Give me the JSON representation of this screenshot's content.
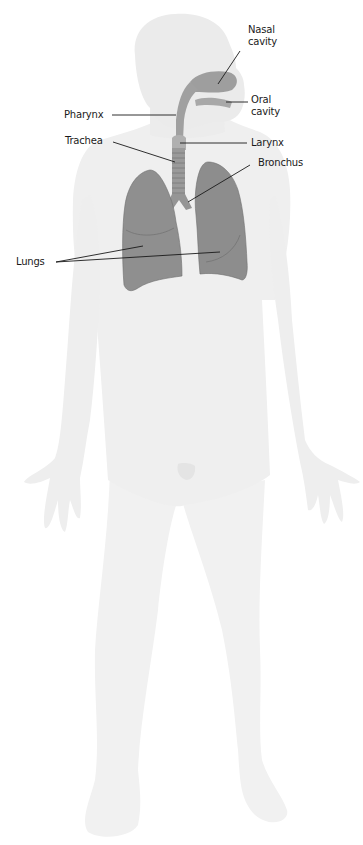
{
  "diagram": {
    "colors": {
      "background": "#ffffff",
      "body": "#efefef",
      "body_shade": "#e6e6e6",
      "head": "#eaeaea",
      "organ": "#8f8f8f",
      "organ_dark": "#7a7a7a",
      "airway": "#a3a3a3",
      "leader_line": "#1a1a1a",
      "label_text": "#1a1a1a"
    },
    "labels": {
      "nasal_cavity": [
        "Nasal",
        "cavity"
      ],
      "oral_cavity": [
        "Oral",
        "cavity"
      ],
      "pharynx": "Pharynx",
      "trachea": "Trachea",
      "larynx": "Larynx",
      "bronchus": "Bronchus",
      "lungs": "Lungs"
    }
  }
}
